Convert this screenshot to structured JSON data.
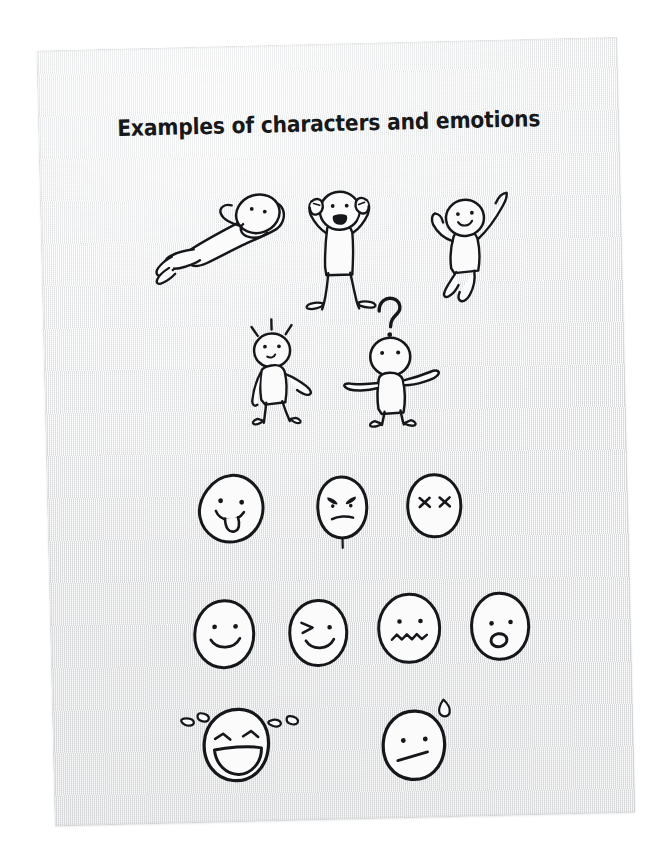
{
  "page": {
    "title": "Examples of characters and emotions",
    "medium": "hand-drawn sketch on textured paper",
    "ink_color": "#15171a",
    "paper_color": "#eff0f0",
    "background_color": "#ffffff"
  },
  "rows": [
    {
      "name": "full-body-poses-row-1",
      "items": [
        {
          "id": "figure-reclining",
          "label": "reclining relaxed figure, hands behind head"
        },
        {
          "id": "figure-shouting",
          "label": "figure with both arms raised, shouting"
        },
        {
          "id": "figure-jumping",
          "label": "jumping figure with one arm raised, smiling"
        }
      ]
    },
    {
      "name": "full-body-poses-row-2",
      "items": [
        {
          "id": "figure-surprised",
          "label": "startled figure with surprise lines above head"
        },
        {
          "id": "figure-confused",
          "label": "confused figure with question mark and open arms"
        }
      ]
    },
    {
      "name": "faces-row-1",
      "items": [
        {
          "id": "face-tongue-out",
          "label": "playful face with tongue sticking out"
        },
        {
          "id": "face-angry",
          "label": "angry face with furrowed brows"
        },
        {
          "id": "face-dizzy",
          "label": "face with x-shaped eyes"
        }
      ]
    },
    {
      "name": "faces-row-2",
      "items": [
        {
          "id": "face-smiling",
          "label": "smiling face"
        },
        {
          "id": "face-winking",
          "label": "winking face"
        },
        {
          "id": "face-nervous",
          "label": "nervous face with wavy mouth"
        },
        {
          "id": "face-shocked",
          "label": "shocked face with open oval mouth"
        }
      ]
    },
    {
      "name": "faces-row-3",
      "items": [
        {
          "id": "face-laughing",
          "label": "laughing face with tears of joy"
        },
        {
          "id": "face-awkward",
          "label": "awkward face with sweat drop"
        }
      ]
    }
  ]
}
